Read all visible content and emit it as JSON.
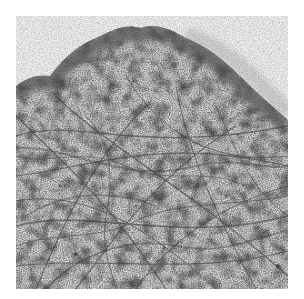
{
  "image": {
    "kind": "grayscale electron micrograph",
    "subject": "cell periphery with dense cortical rim and interior filament meshwork",
    "palette": {
      "background": "#ffffff",
      "field": "#f4f4f4",
      "rim": "#4a4a4a",
      "filament": "#3c3c3c",
      "interior": "#c8c8c8"
    }
  }
}
